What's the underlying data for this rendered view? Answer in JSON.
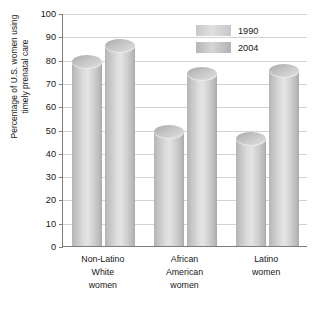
{
  "chart_data": {
    "type": "bar",
    "title": "",
    "xlabel": "",
    "ylabel": "Percentage of U.S. women using\ntimely prenatal care",
    "ylim": [
      0,
      100
    ],
    "ytick_step": 10,
    "yticks": [
      "100",
      "90",
      "80",
      "70",
      "60",
      "50",
      "40",
      "30",
      "20",
      "10",
      "0"
    ],
    "grid": true,
    "legend_position": "top-right",
    "categories": [
      "Non-Latino\nWhite\nwomen",
      "African\nAmerican\nwomen",
      "Latino\nwomen"
    ],
    "series": [
      {
        "name": "1990",
        "values": [
          79,
          49,
          46
        ],
        "color": "#d2d2d2"
      },
      {
        "name": "2004",
        "values": [
          86,
          74,
          75
        ],
        "color": "#c6c6c6"
      }
    ]
  },
  "legend": {
    "items": [
      {
        "label": "1990"
      },
      {
        "label": "2004"
      }
    ]
  }
}
